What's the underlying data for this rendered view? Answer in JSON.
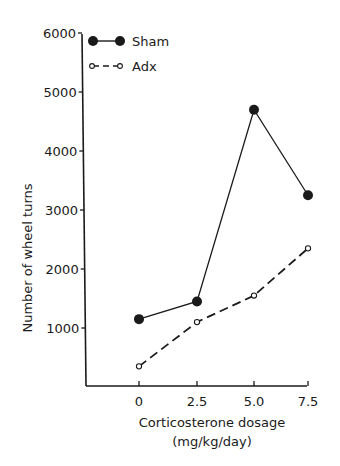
{
  "chart_data": {
    "type": "line",
    "title": "",
    "xlabel": "Corticosterone dosage",
    "xlabel_units": "(mg/kg/day)",
    "ylabel": "Number of wheel turns",
    "x": [
      0,
      2.5,
      5.0,
      7.5
    ],
    "x_tick_labels": [
      "0",
      "2.5",
      "5.0",
      "7.5"
    ],
    "y_ticks": [
      1000,
      2000,
      3000,
      4000,
      5000,
      6000
    ],
    "y_tick_labels": [
      "1000",
      "2000",
      "3000",
      "4000",
      "5000",
      "6000"
    ],
    "ylim": [
      0,
      6000
    ],
    "grid": false,
    "legend_position": "upper left",
    "series": [
      {
        "name": "Sham",
        "marker": "filled-circle",
        "line_style": "solid",
        "values": [
          1150,
          1450,
          4700,
          3250
        ]
      },
      {
        "name": "Adx",
        "marker": "open-circle",
        "line_style": "dashed",
        "values": [
          350,
          1100,
          1550,
          2350
        ]
      }
    ]
  },
  "colors": {
    "ink": "#1a1a1a",
    "background": "#ffffff"
  }
}
